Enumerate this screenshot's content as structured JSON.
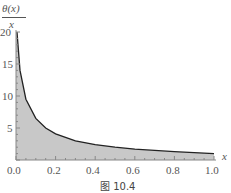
{
  "chart_data": {
    "type": "area",
    "title": "",
    "ylabel": "θ(x)/x",
    "xlabel": "x",
    "caption": "图 10.4",
    "xlim": [
      0,
      1.0
    ],
    "ylim": [
      0,
      20
    ],
    "x_ticks": [
      "0.0",
      "0.2",
      "0.4",
      "0.6",
      "0.8",
      "1.0"
    ],
    "y_ticks": [
      "5",
      "10",
      "15",
      "20"
    ],
    "x": [
      0.005,
      0.02,
      0.05,
      0.1,
      0.15,
      0.2,
      0.3,
      0.4,
      0.5,
      0.6,
      0.7,
      0.8,
      0.9,
      1.0
    ],
    "values": [
      20,
      14,
      9.5,
      6.5,
      5,
      4.1,
      3,
      2.4,
      2,
      1.7,
      1.5,
      1.3,
      1.15,
      1.0
    ],
    "fill_color": "#c8c8c8",
    "line_color": "#222222"
  },
  "labels": {
    "ylabel_num": "θ(x)",
    "ylabel_den": "x",
    "xlabel": "x",
    "caption": "图 10.4",
    "xt": [
      "0.0",
      "0.2",
      "0.4",
      "0.6",
      "0.8",
      "1.0"
    ],
    "yt": [
      "20",
      "15",
      "10",
      "5"
    ]
  }
}
